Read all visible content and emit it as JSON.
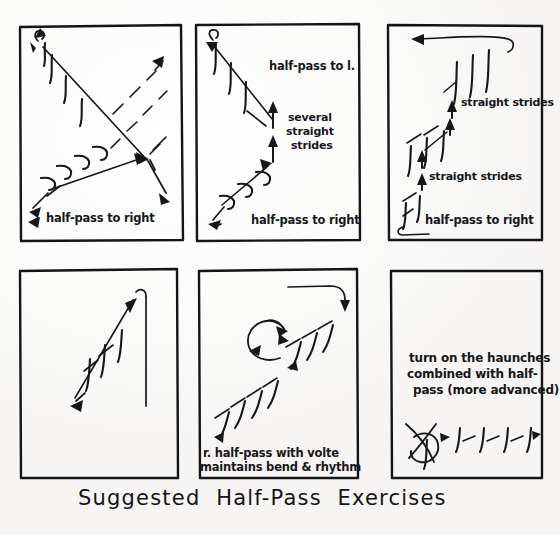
{
  "document": {
    "type": "hand-drawn-diagram",
    "title": "Suggested Half-Pass Exercises",
    "ink_color": "#17171a",
    "paper_color": "#fdfdfc",
    "panel_count": 6,
    "layout": "2 rows x 3 columns of rectangular arena diagrams with a handwritten caption below"
  },
  "panels": [
    {
      "id": "panel-1",
      "position": "row1-col1",
      "labels": [
        {
          "id": "p1-label-1",
          "text": "half-pass to right"
        }
      ],
      "description": "Arena rectangle with two crossing diagonals; half-pass tracks drawn as slanted tick strokes on both diagonals."
    },
    {
      "id": "panel-2",
      "position": "row1-col2",
      "labels": [
        {
          "id": "p2-label-1",
          "text": "half-pass to l."
        },
        {
          "id": "p2-label-2-line1",
          "text": "several"
        },
        {
          "id": "p2-label-2-line2",
          "text": "straight"
        },
        {
          "id": "p2-label-2-line3",
          "text": "strides"
        },
        {
          "id": "p2-label-3",
          "text": "half-pass to right"
        }
      ],
      "description": "Zig-zag: half-pass to right, several straight strides up the centre line, then half-pass to left."
    },
    {
      "id": "panel-3",
      "position": "row1-col3",
      "labels": [
        {
          "id": "p3-label-1",
          "text": "straight strides"
        },
        {
          "id": "p3-label-2",
          "text": "straight strides"
        },
        {
          "id": "p3-label-3",
          "text": "half-pass to right"
        }
      ],
      "description": "Repeating staircase of half-pass segments separated by straight strides, finishing on the top track."
    },
    {
      "id": "panel-4",
      "position": "row2-col1",
      "labels": [],
      "description": "Plain arena with a single diagonal half-pass from the long side, no caption."
    },
    {
      "id": "panel-5",
      "position": "row2-col2",
      "labels": [
        {
          "id": "p5-label-line1",
          "text": "r. half-pass with volte"
        },
        {
          "id": "p5-label-line2",
          "text": "maintains bend & rhythm"
        }
      ],
      "description": "Half-pass interrupted by a circular volte, then half-pass continues."
    },
    {
      "id": "panel-6",
      "position": "row2-col3",
      "labels": [
        {
          "id": "p6-label-line1",
          "text": "turn on the haunches"
        },
        {
          "id": "p6-label-line2",
          "text": "combined with half-"
        },
        {
          "id": "p6-label-line3",
          "text": "pass (more advanced)"
        }
      ],
      "description": "Turn-on-the-haunches pirouette symbol followed by a row of half-pass strides."
    }
  ],
  "caption": {
    "text": "Suggested  Half-Pass  Exercises"
  }
}
